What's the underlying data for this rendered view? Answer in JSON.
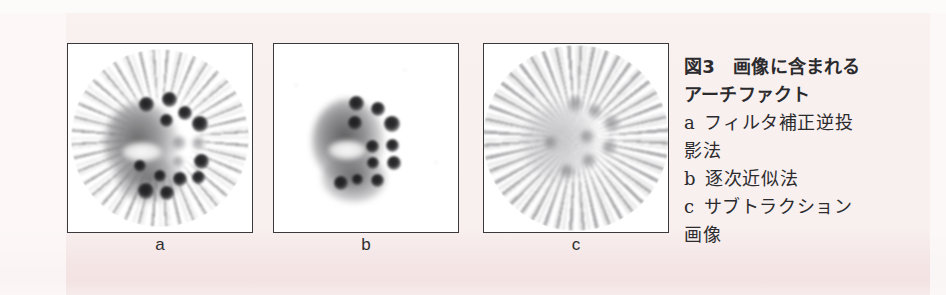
{
  "figure": {
    "background_color": "#f7eeee",
    "panel_border_color": "#3a3a3c",
    "panel_background_color": "#ffffff",
    "ink_color": "#2b2b2d"
  },
  "panels": [
    {
      "id": "a",
      "label": "a",
      "modality_note": "filtered back projection reconstruction with radial streak artifacts"
    },
    {
      "id": "b",
      "label": "b",
      "modality_note": "iterative reconstruction without streak artifacts"
    },
    {
      "id": "c",
      "label": "c",
      "modality_note": "subtraction image dominated by streak artifacts"
    }
  ],
  "caption": {
    "title_lines": [
      "図3　画像に含まれる",
      "アーチファクト"
    ],
    "items": [
      {
        "index": "a",
        "text": "フィルタ補正逆投"
      },
      {
        "index": "",
        "text": "影法"
      },
      {
        "index": "b",
        "text": "逐次近似法"
      },
      {
        "index": "c",
        "text": "サブトラクション"
      },
      {
        "index": "",
        "text": "画像"
      }
    ]
  }
}
